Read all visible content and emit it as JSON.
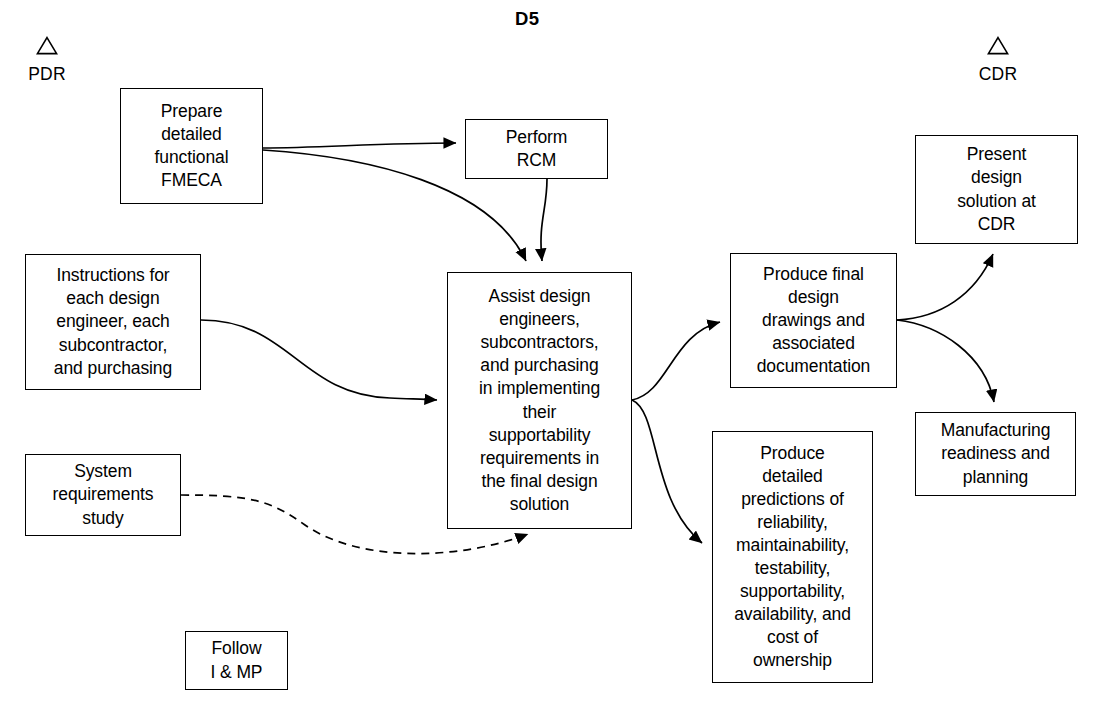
{
  "diagram": {
    "title": "D5",
    "title_pos": {
      "x": 515,
      "y": 8
    }
  },
  "milestones": [
    {
      "name": "pdr",
      "label": "PDR",
      "icon": "triangle-icon",
      "x": 24,
      "y": 36,
      "width": 46
    },
    {
      "name": "cdr",
      "label": "CDR",
      "icon": "triangle-icon",
      "x": 975,
      "y": 36,
      "width": 46
    }
  ],
  "nodes": [
    {
      "name": "prepare-detailed-functional-fmeca",
      "label": "Prepare\ndetailed\nfunctional\nFMECA",
      "x": 120,
      "y": 88,
      "width": 143,
      "height": 116
    },
    {
      "name": "perform-rcm",
      "label": "Perform\nRCM",
      "x": 465,
      "y": 119,
      "width": 143,
      "height": 60
    },
    {
      "name": "instructions-for-each-design-engineer",
      "label": "Instructions for\neach design\nengineer, each\nsubcontractor,\nand purchasing",
      "x": 25,
      "y": 254,
      "width": 176,
      "height": 136
    },
    {
      "name": "system-requirements-study",
      "label": "System\nrequirements\nstudy",
      "x": 25,
      "y": 454,
      "width": 156,
      "height": 82
    },
    {
      "name": "assist-design-engineers",
      "label": "Assist design\nengineers,\nsubcontractors,\nand purchasing\nin implementing\ntheir\nsupportability\nrequirements in\nthe final design\nsolution",
      "x": 447,
      "y": 272,
      "width": 185,
      "height": 257
    },
    {
      "name": "produce-final-design-drawings",
      "label": "Produce final\ndesign\ndrawings and\nassociated\ndocumentation",
      "x": 730,
      "y": 253,
      "width": 167,
      "height": 135
    },
    {
      "name": "produce-detailed-predictions",
      "label": "Produce\ndetailed\npredictions of\nreliability,\nmaintainability,\ntestability,\nsupportability,\navailability, and\ncost of\nownership",
      "x": 712,
      "y": 431,
      "width": 161,
      "height": 252
    },
    {
      "name": "present-design-solution-at-cdr",
      "label": "Present\ndesign\nsolution at\nCDR",
      "x": 915,
      "y": 135,
      "width": 163,
      "height": 109
    },
    {
      "name": "manufacturing-readiness-and-planning",
      "label": "Manufacturing\nreadiness and\nplanning",
      "x": 915,
      "y": 412,
      "width": 161,
      "height": 84
    },
    {
      "name": "follow-i-and-mp",
      "label": "Follow\nI & MP",
      "x": 185,
      "y": 631,
      "width": 103,
      "height": 59
    }
  ],
  "edges": [
    {
      "name": "edge-fmeca-to-rcm",
      "from": "prepare-detailed-functional-fmeca",
      "to": "perform-rcm",
      "style": "solid",
      "path": "M 263,148 C 320,148 380,143 456,143"
    },
    {
      "name": "edge-fmeca-to-assist",
      "from": "prepare-detailed-functional-fmeca",
      "to": "assist-design-engineers",
      "style": "solid",
      "path": "M 263,150 C 370,157 490,185 526,261"
    },
    {
      "name": "edge-rcm-to-assist",
      "from": "perform-rcm",
      "to": "assist-design-engineers",
      "style": "solid",
      "path": "M 547,179 C 547,210 538,222 542,261"
    },
    {
      "name": "edge-instructions-to-assist",
      "from": "instructions-for-each-design-engineer",
      "to": "assist-design-engineers",
      "style": "solid",
      "path": "M 201,320 C 290,320 300,395 390,398 C 410,399 420,399 437,400"
    },
    {
      "name": "edge-system-requirements-to-assist",
      "from": "system-requirements-study",
      "to": "assist-design-engineers",
      "style": "dashed",
      "path": "M 181,495 C 250,495 270,500 305,525 C 360,563 460,560 528,534"
    },
    {
      "name": "edge-assist-to-final-design",
      "from": "assist-design-engineers",
      "to": "produce-final-design-drawings",
      "style": "solid",
      "path": "M 632,400 C 668,393 672,334 720,322"
    },
    {
      "name": "edge-assist-to-predictions",
      "from": "assist-design-engineers",
      "to": "produce-detailed-predictions",
      "style": "solid",
      "path": "M 632,400 C 660,412 650,500 702,543"
    },
    {
      "name": "edge-final-design-to-present-cdr",
      "from": "produce-final-design-drawings",
      "to": "present-design-solution-at-cdr",
      "style": "solid",
      "path": "M 897,320 C 940,318 975,295 993,254"
    },
    {
      "name": "edge-final-design-to-manufacturing",
      "from": "produce-final-design-drawings",
      "to": "manufacturing-readiness-and-planning",
      "style": "solid",
      "path": "M 897,320 C 940,325 985,355 994,402"
    }
  ],
  "style": {
    "line_color": "#000000",
    "box_fill": "#ffffff",
    "background": "#ffffff",
    "line_width": 1.7
  }
}
